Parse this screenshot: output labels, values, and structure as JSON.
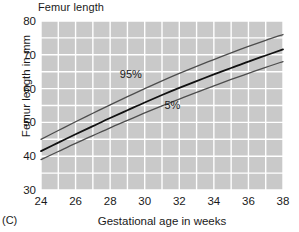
{
  "figure": {
    "panel_label": "(C)",
    "title": "Femur length"
  },
  "chart_data": {
    "type": "line",
    "title": "Femur length",
    "xlabel": "Gestational age in weeks",
    "ylabel": "Femur length in mm",
    "xlim": [
      24,
      38
    ],
    "ylim": [
      30,
      80
    ],
    "xticks": [
      24,
      26,
      28,
      30,
      32,
      34,
      36,
      38
    ],
    "xtick_labels": [
      "24",
      "26",
      "28",
      "30",
      "32",
      "34",
      "36",
      "38"
    ],
    "yticks": [
      30,
      40,
      50,
      60,
      70,
      80
    ],
    "ytick_labels": [
      "30",
      "40",
      "50",
      "60",
      "70",
      "80"
    ],
    "grid": true,
    "grid_color": "#ffffff",
    "grid_x_step": 1,
    "grid_y_step": 5,
    "plot_background": "#c9c9c9",
    "legend": "none",
    "annotations": [
      {
        "text": "95%",
        "x": 29.2,
        "y": 63.2
      },
      {
        "text": "5%",
        "x": 31.6,
        "y": 54.0
      }
    ],
    "x": [
      24,
      25,
      26,
      27,
      28,
      29,
      30,
      31,
      32,
      33,
      34,
      35,
      36,
      37,
      38
    ],
    "series": [
      {
        "name": "95%",
        "color": "#4d4d4d",
        "width": 1.3,
        "values": [
          45.0,
          47.6,
          50.2,
          52.7,
          55.2,
          57.6,
          60.0,
          62.3,
          64.5,
          66.6,
          68.6,
          70.6,
          72.5,
          74.3,
          76.0
        ]
      },
      {
        "name": "50%",
        "color": "#111111",
        "width": 1.8,
        "values": [
          41.5,
          44.0,
          46.5,
          48.9,
          51.3,
          53.6,
          55.9,
          58.1,
          60.2,
          62.2,
          64.2,
          66.1,
          68.0,
          69.8,
          71.6
        ]
      },
      {
        "name": "5%",
        "color": "#4d4d4d",
        "width": 1.3,
        "values": [
          39.0,
          41.4,
          43.8,
          46.1,
          48.4,
          50.6,
          52.8,
          54.9,
          56.9,
          58.9,
          60.8,
          62.7,
          64.5,
          66.3,
          68.0
        ]
      }
    ]
  }
}
